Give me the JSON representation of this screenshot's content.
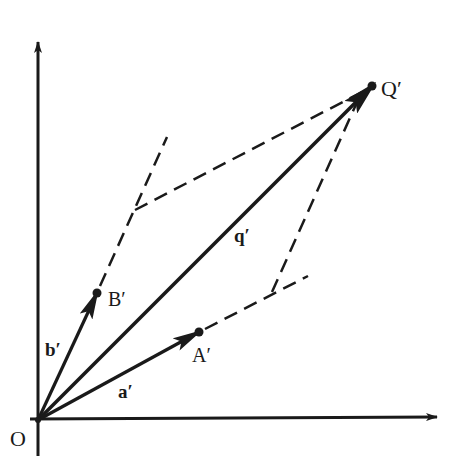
{
  "diagram": {
    "type": "vector-parallelogram",
    "colors": {
      "ink": "#1a1a1a",
      "background": "#ffffff"
    },
    "points": {
      "origin": {
        "label": "O",
        "x": 38,
        "y": 420
      },
      "A": {
        "label": "A′",
        "x": 199,
        "y": 332
      },
      "B": {
        "label": "B′",
        "x": 97,
        "y": 293
      },
      "Q": {
        "label": "Q′",
        "x": 372,
        "y": 86
      }
    },
    "vectors": [
      {
        "name": "a",
        "label": "a′",
        "from": "origin",
        "to": "A"
      },
      {
        "name": "b",
        "label": "b′",
        "from": "origin",
        "to": "B"
      },
      {
        "name": "q",
        "label": "q′",
        "from": "origin",
        "to": "Q"
      }
    ],
    "labels": {
      "origin": "O",
      "point_a": "A′",
      "point_b": "B′",
      "point_q": "Q′",
      "vector_a": "a′",
      "vector_b": "b′",
      "vector_q": "q′"
    },
    "axes": {
      "x_axis": {
        "from": [
          30,
          419
        ],
        "to": [
          437,
          417
        ]
      },
      "y_axis": {
        "from": [
          38,
          456
        ],
        "to": [
          38,
          42
        ]
      }
    },
    "construction_lines": [
      {
        "name": "b-extension",
        "from": [
          97,
          293
        ],
        "to": [
          167,
          137
        ],
        "style": "dashed"
      },
      {
        "name": "a-extension",
        "from": [
          199,
          332
        ],
        "to": [
          308,
          276
        ],
        "style": "dashed"
      },
      {
        "name": "parallel-to-a-through-b-corner",
        "from": [
          135,
          210
        ],
        "to": [
          362,
          92
        ],
        "style": "dashed"
      },
      {
        "name": "parallel-to-b-through-a-corner",
        "from": [
          272,
          292
        ],
        "to": [
          358,
          100
        ],
        "style": "dashed"
      }
    ]
  }
}
